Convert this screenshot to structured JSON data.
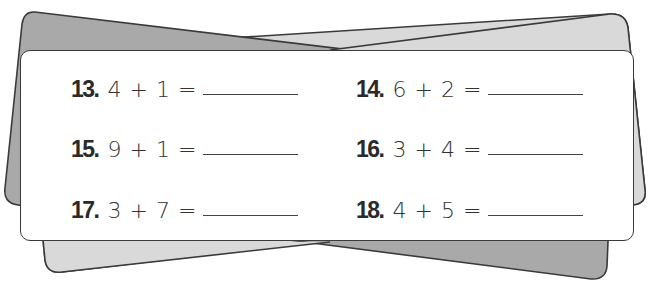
{
  "worksheet": {
    "colors": {
      "back_card_dark": "#a9a9a9",
      "back_card_light": "#d9d9d9",
      "sheet": "#ffffff",
      "outline": "#3a3a3a",
      "text": "#2a2a2a"
    },
    "problems": [
      {
        "number": "13.",
        "expression": "4 + 1 =",
        "answer": ""
      },
      {
        "number": "14.",
        "expression": "6 + 2 =",
        "answer": ""
      },
      {
        "number": "15.",
        "expression": "9 + 1 =",
        "answer": ""
      },
      {
        "number": "16.",
        "expression": "3 + 4 =",
        "answer": ""
      },
      {
        "number": "17.",
        "expression": "3 + 7 =",
        "answer": ""
      },
      {
        "number": "18.",
        "expression": "4 + 5 =",
        "answer": ""
      }
    ]
  }
}
